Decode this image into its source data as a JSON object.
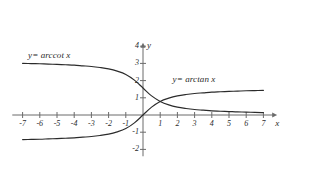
{
  "figure": {
    "axis_x_name": "x",
    "axis_y_name": "y",
    "axis_color": "#6b6b6b",
    "curve_color": "#2b2b2b",
    "background": "#ffffff"
  },
  "labels": {
    "arccot": "y= arccot x",
    "arctan": "y= arctan x"
  },
  "chart_data": {
    "type": "line",
    "title": "",
    "xlabel": "x",
    "ylabel": "y",
    "xlim": [
      -7.6,
      7.8
    ],
    "ylim": [
      -2.4,
      4.2
    ],
    "grid": false,
    "legend": "inline-annotations",
    "x_ticks": [
      -7,
      -6,
      -5,
      -4,
      -3,
      -2,
      -1,
      1,
      2,
      3,
      4,
      5,
      6,
      7
    ],
    "x_tick_labels": [
      "-7",
      "-6",
      "-5",
      "-4",
      "-3",
      "-2",
      "-1",
      "1",
      "2",
      "3",
      "4",
      "5",
      "6",
      "7"
    ],
    "y_ticks": [
      -2,
      -1,
      1,
      2,
      3,
      4
    ],
    "y_tick_labels": [
      "-2",
      "-1",
      "1",
      "2",
      "3",
      "4"
    ],
    "series": [
      {
        "name": "y= arccot x",
        "label_position": {
          "x": -5.4,
          "y": 3.45
        },
        "x": [
          -7,
          -6.5,
          -6,
          -5.5,
          -5,
          -4.5,
          -4,
          -3.5,
          -3,
          -2.5,
          -2,
          -1.5,
          -1,
          -0.5,
          0,
          0.5,
          1,
          1.5,
          2,
          2.5,
          3,
          3.5,
          4,
          4.5,
          5,
          5.5,
          6,
          6.5,
          7
        ],
        "values": [
          3.0,
          2.99,
          2.98,
          2.96,
          2.94,
          2.92,
          2.9,
          2.86,
          2.82,
          2.76,
          2.68,
          2.55,
          2.36,
          2.03,
          1.57,
          1.11,
          0.79,
          0.59,
          0.46,
          0.38,
          0.32,
          0.28,
          0.24,
          0.22,
          0.2,
          0.18,
          0.17,
          0.15,
          0.14
        ]
      },
      {
        "name": "y= arctan x",
        "label_position": {
          "x": 3.0,
          "y": 2.05
        },
        "x": [
          -7,
          -6.5,
          -6,
          -5.5,
          -5,
          -4.5,
          -4,
          -3.5,
          -3,
          -2.5,
          -2,
          -1.5,
          -1,
          -0.5,
          0,
          0.5,
          1,
          1.5,
          2,
          2.5,
          3,
          3.5,
          4,
          4.5,
          5,
          5.5,
          6,
          6.5,
          7
        ],
        "values": [
          -1.43,
          -1.42,
          -1.41,
          -1.39,
          -1.37,
          -1.35,
          -1.33,
          -1.29,
          -1.25,
          -1.19,
          -1.11,
          -0.98,
          -0.79,
          -0.46,
          0.0,
          0.46,
          0.79,
          0.98,
          1.11,
          1.19,
          1.25,
          1.29,
          1.33,
          1.35,
          1.37,
          1.39,
          1.41,
          1.42,
          1.43
        ]
      }
    ]
  }
}
